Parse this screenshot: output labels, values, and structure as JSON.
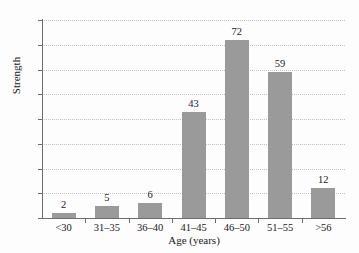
{
  "chart_data": {
    "type": "bar",
    "title": "",
    "subtitle": "",
    "xlabel": "Age (years)",
    "ylabel": "Strength",
    "categories": [
      "<30",
      "31–35",
      "36–40",
      "41–45",
      "46–50",
      "51–55",
      ">56"
    ],
    "values": [
      2,
      5,
      6,
      43,
      72,
      59,
      12
    ],
    "value_labels": [
      "2",
      "5",
      "6",
      "43",
      "72",
      "59",
      "12"
    ],
    "ylim": [
      0,
      80
    ],
    "ytick_step": 10,
    "ytick_labels": [
      "0",
      "10",
      "20",
      "30",
      "40",
      "50",
      "60",
      "70",
      "80"
    ],
    "grid": true,
    "grid_axis": "y",
    "grid_style": "dotted",
    "legend": false,
    "legend_position": "none",
    "bar_color": "#9a9a9a",
    "axis_color": "#6d6d6d",
    "grid_color": "#c2c2c2",
    "text_color": "#1a1a1a",
    "background_color": "#fdfdfd"
  },
  "caption": {
    "text": ""
  }
}
